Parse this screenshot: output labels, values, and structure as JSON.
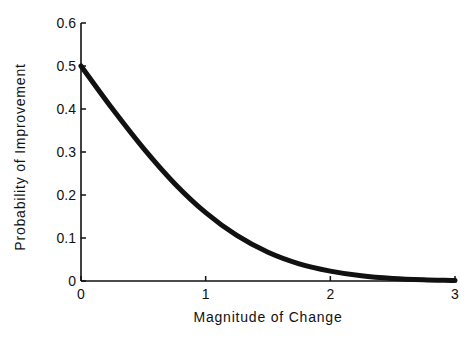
{
  "chart_data": {
    "type": "line",
    "title": "",
    "xlabel": "Magnitude of Change",
    "ylabel": "Probability of Improvement",
    "xlim": [
      0,
      3
    ],
    "ylim": [
      0,
      0.6
    ],
    "x_ticks": [
      "0",
      "1",
      "2",
      "3"
    ],
    "y_ticks": [
      "0",
      "0.1",
      "0.2",
      "0.3",
      "0.4",
      "0.5",
      "0.6"
    ],
    "grid": false,
    "legend": null,
    "series": [
      {
        "name": "Probability of Improvement",
        "x": [
          0,
          0.25,
          0.5,
          0.75,
          1.0,
          1.25,
          1.5,
          1.75,
          2.0,
          2.25,
          2.5,
          2.75,
          3.0
        ],
        "values": [
          0.5,
          0.401,
          0.309,
          0.227,
          0.159,
          0.106,
          0.067,
          0.04,
          0.023,
          0.012,
          0.006,
          0.003,
          0.001
        ]
      }
    ]
  },
  "colors": {
    "line": "#111111",
    "axis": "#111111",
    "background": "#ffffff"
  }
}
